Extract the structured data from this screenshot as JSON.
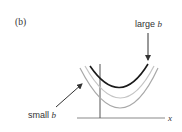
{
  "panel": {
    "label": "(b)"
  },
  "annotations": {
    "large": {
      "prefix": "large ",
      "var": "b"
    },
    "small": {
      "prefix": "small ",
      "var": "b"
    }
  },
  "axis": {
    "x_label": "x"
  },
  "curves": [
    {
      "name": "large-b-curve",
      "color": "#1a1a1a",
      "width": 1.6
    },
    {
      "name": "medium-b-curve",
      "color": "#bdbdbd",
      "width": 1.2
    },
    {
      "name": "small-b-curve",
      "color": "#a8a8a8",
      "width": 1.2
    }
  ],
  "colors": {
    "axis": "#8a8a8a",
    "vertical_line": "#555555",
    "arrow": "#333333"
  }
}
